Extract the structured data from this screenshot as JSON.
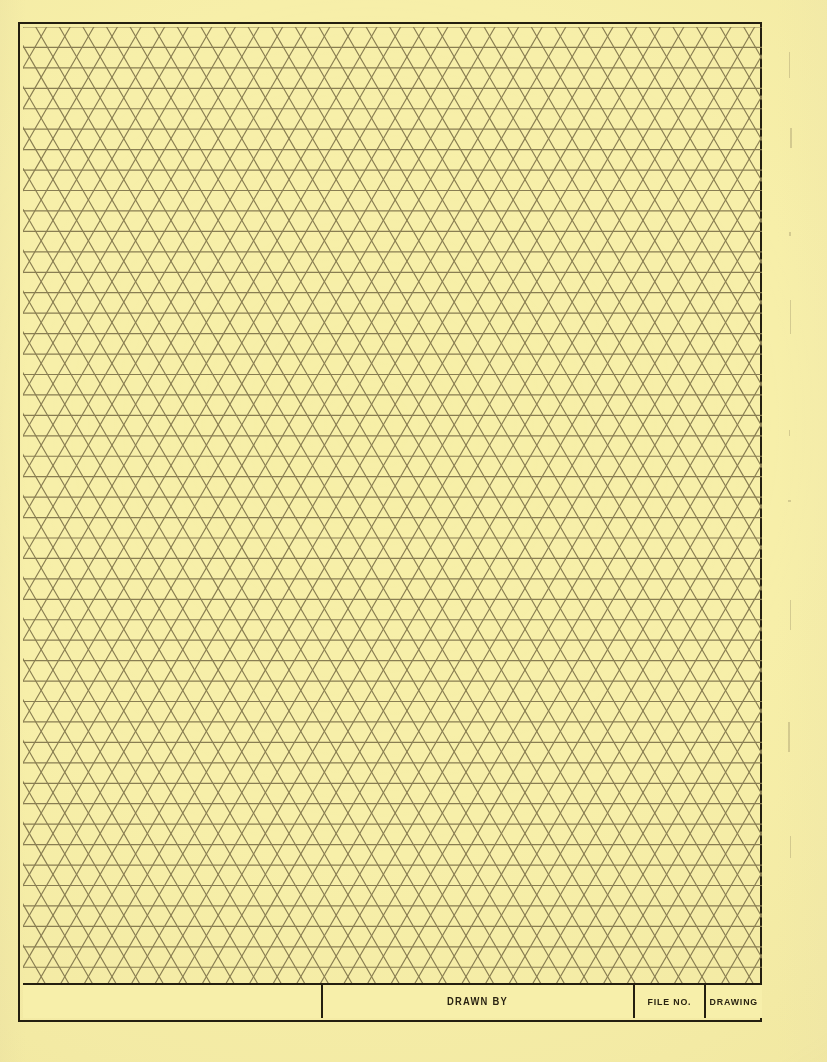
{
  "document": {
    "kind": "isometric-triangular-graph-paper",
    "paper_color": "#F7EFAA",
    "grid_line_color": "#897E52",
    "frame_color": "#241F10",
    "text_color": "#2A2312"
  },
  "grid": {
    "type": "triangular-isometric",
    "triangle_edge_px": 23.6,
    "row_height_px": 20.44,
    "line_width_px": 1.15,
    "directions": [
      "horizontal",
      "diagonal-60",
      "diagonal-120"
    ]
  },
  "frame": {
    "left": 18,
    "top": 22,
    "width": 744,
    "height": 1000,
    "border_width": 2.5
  },
  "title_block": {
    "height": 35,
    "cells": [
      {
        "name": "blank",
        "label": "",
        "width": 300
      },
      {
        "name": "drawn-by",
        "label": "DRAWN BY",
        "width": 312
      },
      {
        "name": "file-no",
        "label": "FILE NO.",
        "width": 71
      },
      {
        "name": "drawing",
        "label": "DRAWING",
        "width": 56
      }
    ]
  },
  "edge_marks": [
    {
      "x": 789,
      "y": 52,
      "w": 1.4,
      "h": 26
    },
    {
      "x": 790,
      "y": 128,
      "w": 1.6,
      "h": 20
    },
    {
      "x": 789,
      "y": 232,
      "w": 2.0,
      "h": 4
    },
    {
      "x": 790,
      "y": 300,
      "w": 1.2,
      "h": 34
    },
    {
      "x": 789,
      "y": 430,
      "w": 1.4,
      "h": 6
    },
    {
      "x": 788,
      "y": 500,
      "w": 3.0,
      "h": 2.2
    },
    {
      "x": 790,
      "y": 600,
      "w": 1.2,
      "h": 30
    },
    {
      "x": 788,
      "y": 722,
      "w": 2.4,
      "h": 30
    },
    {
      "x": 790,
      "y": 836,
      "w": 1.2,
      "h": 22
    }
  ]
}
